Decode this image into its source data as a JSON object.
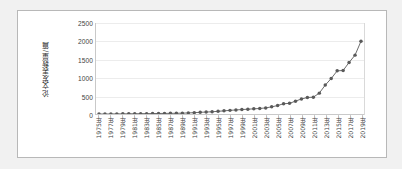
{
  "chart_data": {
    "type": "line",
    "title": "",
    "xlabel": "",
    "ylabel": "论文发表数量/篇",
    "ylim": [
      0,
      2500
    ],
    "ytick_values": [
      0,
      500,
      1000,
      1500,
      2000,
      2500
    ],
    "ytick_labels": [
      "0",
      "500",
      "1000",
      "1500",
      "2000",
      "2500"
    ],
    "grid": true,
    "legend": "none",
    "marker": "circle",
    "series_color": "#595959",
    "gridline_color": "#ececec",
    "x": [
      "1975年",
      "1976年",
      "1977年",
      "1978年",
      "1979年",
      "1980年",
      "1981年",
      "1982年",
      "1983年",
      "1984年",
      "1985年",
      "1986年",
      "1987年",
      "1988年",
      "1989年",
      "1990年",
      "1991年",
      "1992年",
      "1993年",
      "1994年",
      "1995年",
      "1996年",
      "1997年",
      "1998年",
      "1999年",
      "2000年",
      "2001年",
      "2002年",
      "2003年",
      "2004年",
      "2005年",
      "2006年",
      "2007年",
      "2008年",
      "2009年",
      "2010年",
      "2011年",
      "2012年",
      "2013年",
      "2014年",
      "2015年",
      "2016年",
      "2017年",
      "2018年",
      "2019年"
    ],
    "xtick_labels": [
      "1975年",
      "1977年",
      "1979年",
      "1981年",
      "1983年",
      "1985年",
      "1987年",
      "1989年",
      "1991年",
      "1993年",
      "1995年",
      "1997年",
      "1999年",
      "2001年",
      "2003年",
      "2005年",
      "2007年",
      "2009年",
      "2011年",
      "2013年",
      "2015年",
      "2017年",
      "2019年"
    ],
    "values": [
      8,
      9,
      10,
      12,
      13,
      14,
      16,
      17,
      19,
      21,
      23,
      25,
      27,
      29,
      32,
      38,
      45,
      55,
      62,
      70,
      82,
      95,
      108,
      120,
      130,
      140,
      150,
      160,
      175,
      205,
      240,
      290,
      300,
      360,
      420,
      460,
      470,
      580,
      800,
      980,
      1190,
      1200,
      1420,
      1620,
      2000
    ]
  }
}
